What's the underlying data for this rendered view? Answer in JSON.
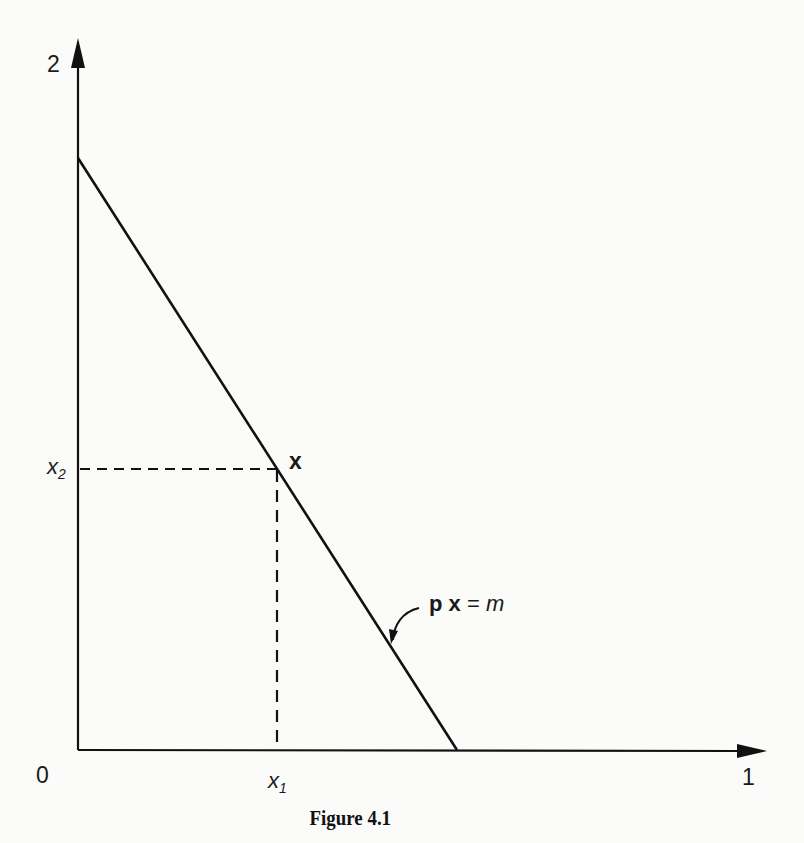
{
  "figure": {
    "caption": "Figure 4.1",
    "axes": {
      "x_axis_end_label": "1",
      "y_axis_end_label": "2",
      "origin_label": "0"
    },
    "point": {
      "label": "x",
      "x_coord_label_base": "x",
      "x_coord_label_sub": "1",
      "y_coord_label_base": "x",
      "y_coord_label_sub": "2"
    },
    "budget_line": {
      "label_p": "p",
      "label_x": "x",
      "label_eq": "=",
      "label_m": "m"
    },
    "colors": {
      "ink": "#111111",
      "paper": "#fbfbf9"
    }
  }
}
